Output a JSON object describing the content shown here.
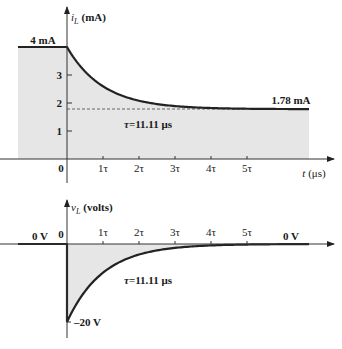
{
  "chart_data": [
    {
      "type": "line",
      "title": "",
      "ylabel": "i_L (mA)",
      "ylabel_var": "i",
      "ylabel_sub": "L",
      "ylabel_unit": "(mA)",
      "xlabel": "t (μs)",
      "xlabel_var": "t",
      "xlabel_unit": "(μs)",
      "x_ticks": [
        "1τ",
        "2τ",
        "3τ",
        "4τ",
        "5τ"
      ],
      "x_origin_label": "0",
      "y_ticks": [
        "1",
        "2",
        "3"
      ],
      "y_ticks_values": [
        1,
        2,
        3
      ],
      "ylim": [
        0,
        4.5
      ],
      "series": [
        {
          "name": "i_L",
          "description": "4 mA before t=0, then exponential decay to 1.78 mA",
          "x_tau": [
            -1.3,
            0,
            0.5,
            1,
            1.5,
            2,
            2.5,
            3,
            3.5,
            4,
            4.5,
            5,
            6.7
          ],
          "values": [
            4,
            4,
            3.13,
            2.6,
            2.28,
            2.08,
            1.96,
            1.89,
            1.85,
            1.82,
            1.8,
            1.79,
            1.78
          ]
        }
      ],
      "annotations": {
        "initial": "4 mA",
        "final": "1.78 mA",
        "tau": "τ=11.11 μs"
      },
      "dashed_asymptote": 1.78,
      "shaded_area": true
    },
    {
      "type": "line",
      "title": "",
      "ylabel": "v_L (volts)",
      "ylabel_var": "v",
      "ylabel_sub": "L",
      "ylabel_unit": "(volts)",
      "x_ticks": [
        "1τ",
        "2τ",
        "3τ",
        "4τ",
        "5τ"
      ],
      "x_origin_label": "0",
      "ylim": [
        -24,
        2
      ],
      "series": [
        {
          "name": "v_L",
          "description": "0 V before t=0, jumps to -20 V at t=0 then decays to 0 V",
          "x_tau": [
            -1.3,
            0,
            0,
            0.25,
            0.5,
            1,
            1.5,
            2,
            3,
            4,
            5,
            6.7
          ],
          "values": [
            0,
            0,
            -20,
            -15.6,
            -12.1,
            -7.36,
            -4.46,
            -2.71,
            -1.0,
            -0.37,
            -0.13,
            0
          ]
        }
      ],
      "annotations": {
        "left": "0 V",
        "right": "0 V",
        "peak": "–20 V",
        "tau": "τ=11.11 μs"
      },
      "shaded_area": true
    }
  ],
  "colors": {
    "fill": "#e6e6e6",
    "curve": "#222222",
    "axis": "#333333",
    "dash": "#666666"
  }
}
